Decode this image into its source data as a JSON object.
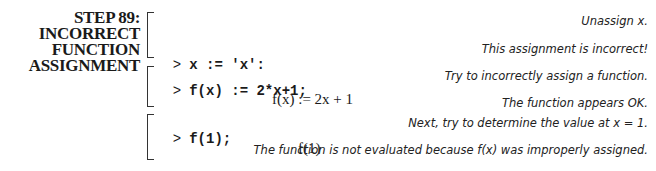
{
  "step": {
    "title_lines": [
      "STEP 89:",
      "INCORRECT",
      "FUNCTION",
      "ASSIGNMENT"
    ]
  },
  "groups": [
    {
      "input": "x := 'x':",
      "comments": [
        "Unassign x.",
        "This assignment is incorrect!"
      ]
    },
    {
      "input": "f(x) := 2*x+1;",
      "comment_input": "Try to incorrectly assign a function.",
      "output": "f(x) := 2x + 1",
      "comment_output": "The function appears OK."
    },
    {
      "input": "f(1);",
      "comment_input": "Next, try to determine the value at x = 1.",
      "output": "f(1)",
      "comment_output": "The function is not evaluated because f(x) was improperly assigned."
    }
  ],
  "prompt_symbol": ">"
}
